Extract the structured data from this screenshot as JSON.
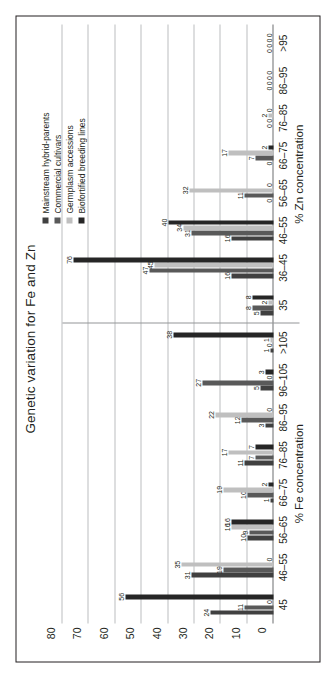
{
  "chart": {
    "title": "Genetic variation for Fe and Zn",
    "legend": [
      {
        "label": "Mainstream hybrid-parents",
        "color": "#404040"
      },
      {
        "label": "Commercial cultivars",
        "color": "#595959"
      },
      {
        "label": "Germplasm accessions",
        "color": "#bfbfbf"
      },
      {
        "label": "Biofortified breeding lines",
        "color": "#262626"
      }
    ],
    "yticks": [
      "0",
      "10",
      "20",
      "30",
      "40",
      "50",
      "60",
      "70",
      "80"
    ],
    "panels": [
      {
        "caption": "% Fe concentration"
      },
      {
        "caption": "% Zn concentration"
      }
    ]
  },
  "chart_data": {
    "type": "bar",
    "title": "Genetic variation for Fe and Zn",
    "ylabel": "",
    "xlabel": "",
    "ylim": [
      0,
      80
    ],
    "yticks": [
      0,
      10,
      20,
      30,
      40,
      50,
      60,
      70,
      80
    ],
    "grid": true,
    "legend_position": "top-right",
    "orientation": "vertical-bars-rotated-90ccw",
    "panels": [
      {
        "name": "Fe",
        "xlabel": "% Fe concentration",
        "categories": [
          "45",
          "46–55",
          "56–65",
          "66–75",
          "76–85",
          "86–95",
          "96–105",
          ">105"
        ],
        "series": [
          {
            "name": "Mainstream hybrid-parents",
            "color": "#404040",
            "values": [
              24,
              31,
              10,
              1,
              11,
              3,
              5,
              1
            ]
          },
          {
            "name": "Commercial cultivars",
            "color": "#595959",
            "values": [
              11,
              19,
              9,
              10,
              7,
              12,
              27,
              0
            ]
          },
          {
            "name": "Germplasm accessions",
            "color": "#bfbfbf",
            "values": [
              0,
              35,
              16,
              19,
              17,
              22,
              0,
              1
            ]
          },
          {
            "name": "Biofortified breeding lines",
            "color": "#262626",
            "values": [
              56,
              0,
              16,
              2,
              7,
              0,
              3,
              38
            ]
          }
        ]
      },
      {
        "name": "Zn",
        "xlabel": "% Zn concentration",
        "categories": [
          "35",
          "36–45",
          "46–55",
          "56–65",
          "66–75",
          "76–85",
          "86–95",
          ">95"
        ],
        "series": [
          {
            "name": "Mainstream hybrid-parents",
            "color": "#404040",
            "values": [
              5,
              16,
              16,
              0,
              0,
              0,
              0,
              0
            ]
          },
          {
            "name": "Commercial cultivars",
            "color": "#595959",
            "values": [
              8,
              47,
              31,
              11,
              7,
              0,
              0,
              0
            ]
          },
          {
            "name": "Germplasm accessions",
            "color": "#bfbfbf",
            "values": [
              2,
              45,
              34,
              32,
              17,
              2,
              0,
              0
            ]
          },
          {
            "name": "Biofortified breeding lines",
            "color": "#262626",
            "values": [
              8,
              76,
              40,
              0,
              2,
              0,
              0,
              0
            ]
          }
        ]
      }
    ]
  }
}
